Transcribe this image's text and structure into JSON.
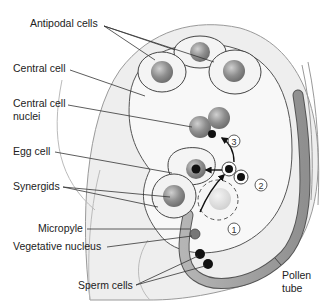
{
  "diagram": {
    "labels": {
      "antipodal_cells": "Antipodal cells",
      "central_cell": "Central cell",
      "central_cell_nuclei_1": "Central cell",
      "central_cell_nuclei_2": "nuclei",
      "egg_cell": "Egg cell",
      "synergids": "Synergids",
      "micropyle": "Micropyle",
      "vegetative_nucleus": "Vegetative nucleus",
      "sperm_cells": "Sperm cells",
      "pollen_tube_1": "Pollen",
      "pollen_tube_2": "tube"
    },
    "steps": [
      "1",
      "2",
      "3"
    ],
    "colors": {
      "ovule_fill": "#ececec",
      "embryo_sac_fill": "#f7f7f7",
      "nucleus_gray": "#8c8c8c",
      "pollen_tube": "#9a9a9a",
      "sperm": "#1a1a1a",
      "outline": "#555555"
    }
  }
}
